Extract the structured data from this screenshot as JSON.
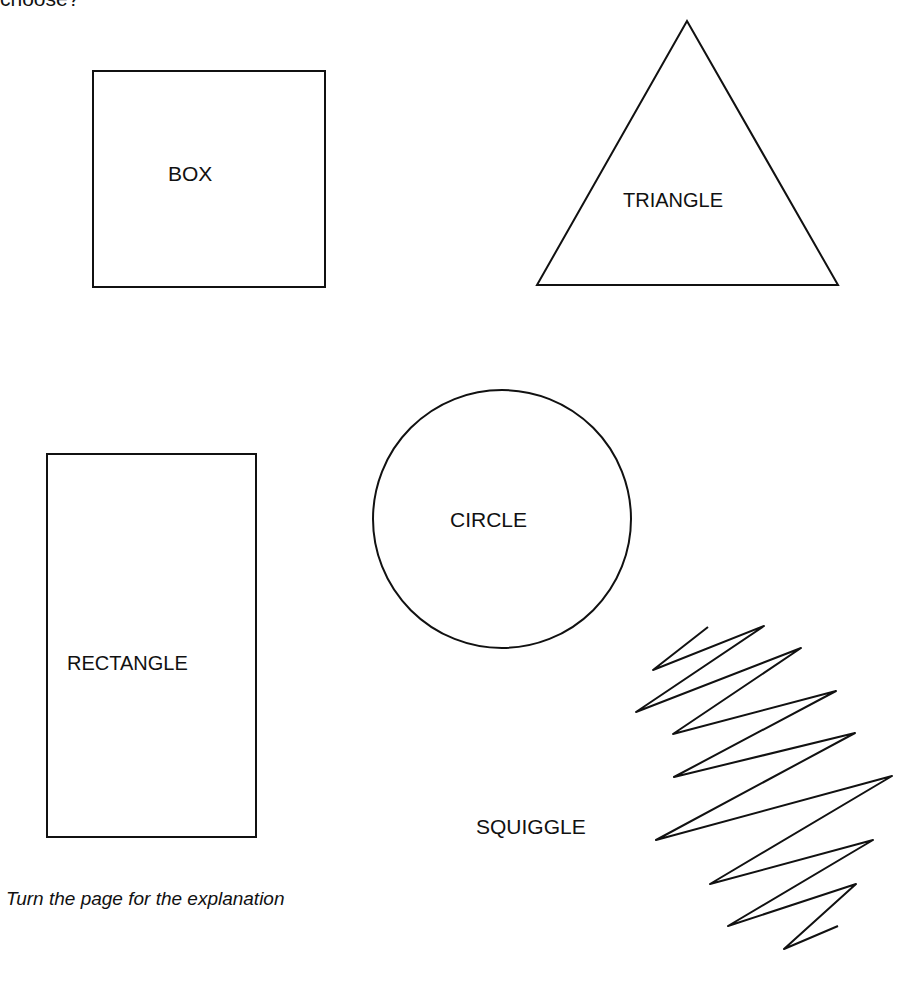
{
  "page": {
    "cut_heading": "choose?",
    "footer_note": "Turn the page for the explanation"
  },
  "shapes": [
    {
      "id": "box",
      "label": "BOX",
      "type": "square"
    },
    {
      "id": "triangle",
      "label": "TRIANGLE",
      "type": "triangle"
    },
    {
      "id": "circle",
      "label": "CIRCLE",
      "type": "circle"
    },
    {
      "id": "rectangle",
      "label": "RECTANGLE",
      "type": "rectangle"
    },
    {
      "id": "squiggle",
      "label": "SQUIGGLE",
      "type": "squiggle"
    }
  ],
  "colors": {
    "stroke": "#111111",
    "background": "#ffffff"
  }
}
